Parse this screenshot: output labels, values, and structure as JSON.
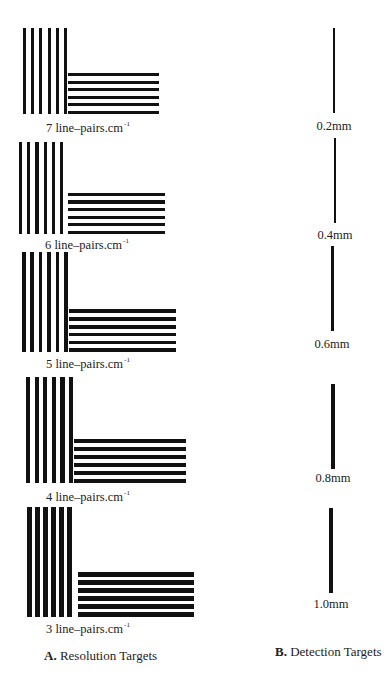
{
  "resolution_targets": {
    "caption_letter": "A.",
    "caption_text": " Resolution Targets",
    "unit_text": " line–pairs.cm",
    "unit_superscript": "-1",
    "groups": [
      {
        "value": "7",
        "label": "7 line–pairs.cm",
        "v": {
          "x": 23,
          "y": 28,
          "h": 86,
          "barw": 3,
          "pitch": 8.2
        },
        "hz": {
          "x": 68,
          "y": 72,
          "w": 91,
          "barh": 3,
          "pitch": 7.6
        },
        "label_pos": {
          "x": 46,
          "y": 120
        }
      },
      {
        "value": "6",
        "label": "6 line–pairs.cm",
        "v": {
          "x": 19,
          "y": 142,
          "h": 92,
          "barw": 3.2,
          "pitch": 8.2
        },
        "hz": {
          "x": 68,
          "y": 192,
          "w": 97,
          "barh": 3.2,
          "pitch": 7.6
        },
        "label_pos": {
          "x": 45,
          "y": 237
        }
      },
      {
        "value": "5",
        "label": "5 line–pairs.cm",
        "v": {
          "x": 22,
          "y": 252,
          "h": 100,
          "barw": 3.6,
          "pitch": 8.4
        },
        "hz": {
          "x": 69,
          "y": 311,
          "w": 107,
          "barh": 3.6,
          "pitch": 7.8
        },
        "label_pos": {
          "x": 46,
          "y": 356
        }
      },
      {
        "value": "4",
        "label": "4 line–pairs.cm",
        "v": {
          "x": 26,
          "y": 377,
          "h": 106,
          "barw": 4.3,
          "pitch": 8.6
        },
        "hz": {
          "x": 74,
          "y": 441,
          "w": 112,
          "barh": 4.3,
          "pitch": 8.0
        },
        "label_pos": {
          "x": 46,
          "y": 489
        }
      },
      {
        "value": "3",
        "label": "3 line–pairs.cm",
        "v": {
          "x": 27,
          "y": 507,
          "h": 110,
          "barw": 5.0,
          "pitch": 8.0
        },
        "hz": {
          "x": 78,
          "y": 572,
          "w": 116,
          "barh": 5.0,
          "pitch": 8.0
        },
        "label_pos": {
          "x": 46,
          "y": 621
        }
      }
    ]
  },
  "detection_targets": {
    "caption_letter": "B.",
    "caption_text": " Detection Targets",
    "lines": [
      {
        "label": "0.2mm",
        "x": 334,
        "y": 28,
        "h": 85,
        "w": 1.2,
        "label_y": 119
      },
      {
        "label": "0.4mm",
        "x": 335,
        "y": 138,
        "h": 85,
        "w": 2.0,
        "label_y": 228
      },
      {
        "label": "0.6mm",
        "x": 332,
        "y": 246,
        "h": 85,
        "w": 3.0,
        "label_y": 337
      },
      {
        "label": "0.8mm",
        "x": 333,
        "y": 384,
        "h": 85,
        "w": 3.8,
        "label_y": 471
      },
      {
        "label": "1.0mm",
        "x": 331,
        "y": 508,
        "h": 85,
        "w": 4.8,
        "label_y": 597
      }
    ]
  },
  "captions": {
    "a": {
      "x": 44,
      "y": 648
    },
    "b": {
      "x": 275,
      "y": 644
    }
  },
  "colors": {
    "ink": "#111111",
    "background": "#ffffff"
  }
}
